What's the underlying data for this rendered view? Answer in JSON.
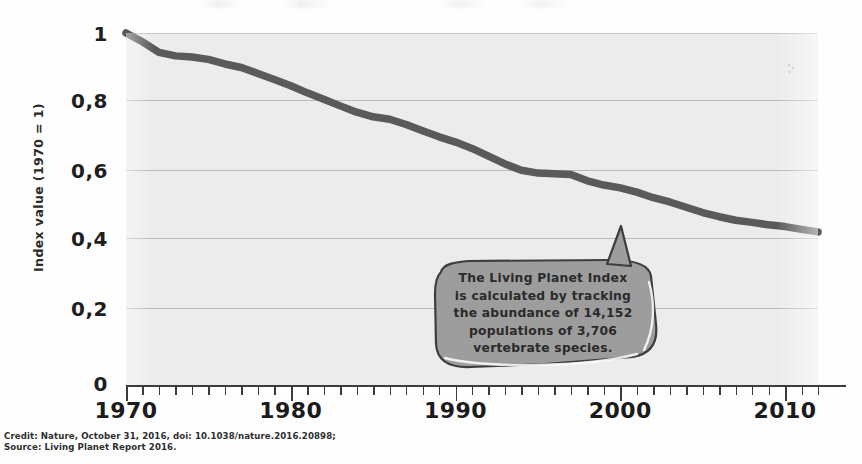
{
  "figure": {
    "background_color": "#fefefe",
    "plot_background_color": "#ececec",
    "line_color": "#5a5a5a",
    "gridline_color": "#b9b9b9",
    "axis_color": "#3c3c3c"
  },
  "axes": {
    "ylabel": "Index value (1970 = 1)",
    "ytick_labels": [
      "1",
      "0,8",
      "0,6",
      "0,4",
      "0,2",
      "0"
    ],
    "ytick_values": [
      1,
      0.8,
      0.6,
      0.4,
      0.2,
      0
    ],
    "xtick_labels": [
      "1970",
      "1980",
      "1990",
      "2000",
      "2010"
    ],
    "xtick_values": [
      1970,
      1980,
      1990,
      2000,
      2010
    ]
  },
  "annotation": {
    "lines": [
      "The Living Planet Index",
      "is calculated by tracking",
      "the abundance of 14,152",
      "populations of 3,706",
      "vertebrate species."
    ],
    "fill_color": "#9d9d9d",
    "border_color": "#3e3e3e"
  },
  "credit": {
    "line1": "Credit: Nature, October 31, 2016, doi: 10.1038/nature.2016.20898;",
    "line2": "Source: Living Planet Report 2016."
  },
  "chart_data": {
    "type": "line",
    "title": "",
    "xlabel": "",
    "ylabel": "Index value (1970 = 1)",
    "xlim": [
      1970,
      2012
    ],
    "ylim": [
      0,
      1
    ],
    "grid": true,
    "legend": "none",
    "series": [
      {
        "name": "Living Planet Index",
        "color": "#5a5a5a",
        "x": [
          1970,
          1971,
          1972,
          1973,
          1974,
          1975,
          1976,
          1977,
          1978,
          1979,
          1980,
          1981,
          1982,
          1983,
          1984,
          1985,
          1986,
          1987,
          1988,
          1989,
          1990,
          1991,
          1992,
          1993,
          1994,
          1995,
          1996,
          1997,
          1998,
          1999,
          2000,
          2001,
          2002,
          2003,
          2004,
          2005,
          2006,
          2007,
          2008,
          2009,
          2010,
          2011,
          2012
        ],
        "values": [
          1.0,
          0.975,
          0.945,
          0.935,
          0.932,
          0.925,
          0.912,
          0.902,
          0.885,
          0.868,
          0.85,
          0.83,
          0.812,
          0.793,
          0.775,
          0.762,
          0.755,
          0.74,
          0.722,
          0.705,
          0.69,
          0.672,
          0.65,
          0.628,
          0.61,
          0.602,
          0.6,
          0.598,
          0.58,
          0.568,
          0.56,
          0.548,
          0.532,
          0.52,
          0.505,
          0.49,
          0.478,
          0.468,
          0.462,
          0.455,
          0.45,
          0.442,
          0.435
        ]
      }
    ]
  }
}
